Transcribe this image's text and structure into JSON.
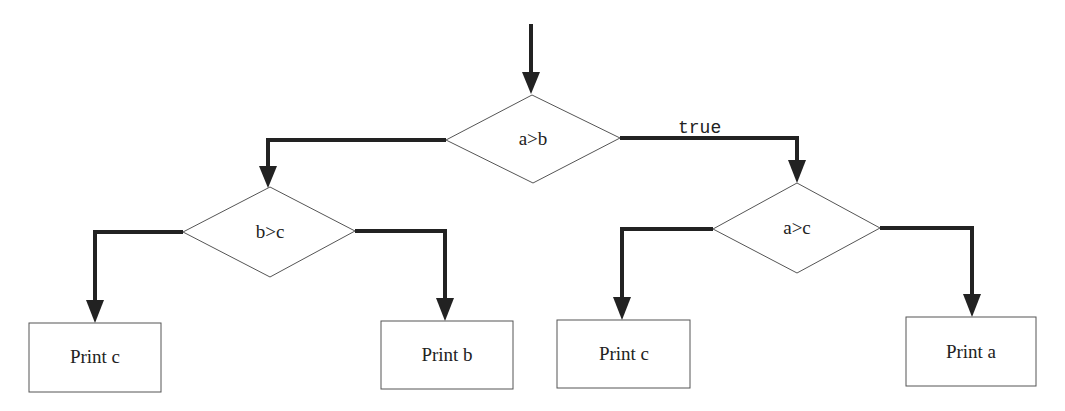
{
  "diagram": {
    "type": "flowchart",
    "decisions": [
      {
        "id": "d1",
        "label": "a>b"
      },
      {
        "id": "d2",
        "label": "b>c"
      },
      {
        "id": "d3",
        "label": "a>c"
      }
    ],
    "processes": [
      {
        "id": "p1",
        "label": "Print c"
      },
      {
        "id": "p2",
        "label": "Print b"
      },
      {
        "id": "p3",
        "label": "Print c"
      },
      {
        "id": "p4",
        "label": "Print a"
      }
    ],
    "edges": [
      {
        "from": "start",
        "to": "d1",
        "label": ""
      },
      {
        "from": "d1",
        "to": "d2",
        "label": ""
      },
      {
        "from": "d1",
        "to": "d3",
        "label": "true"
      },
      {
        "from": "d2",
        "to": "p1",
        "label": ""
      },
      {
        "from": "d2",
        "to": "p2",
        "label": ""
      },
      {
        "from": "d3",
        "to": "p3",
        "label": ""
      },
      {
        "from": "d3",
        "to": "p4",
        "label": ""
      }
    ]
  }
}
